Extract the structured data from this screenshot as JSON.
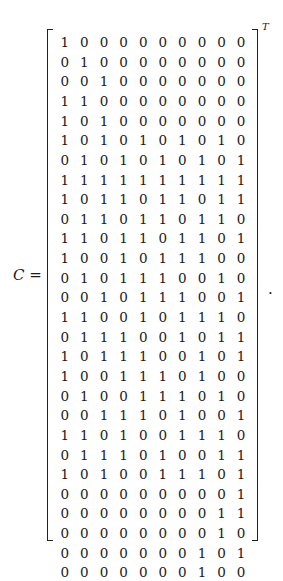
{
  "equation": {
    "lhs_var": "C",
    "equals": "=",
    "superscript": "T",
    "trailing_punct": "."
  },
  "matrix": {
    "rows": [
      [
        "1",
        "0",
        "0",
        "0",
        "0",
        "0",
        "0",
        "0",
        "0",
        "0"
      ],
      [
        "0",
        "1",
        "0",
        "0",
        "0",
        "0",
        "0",
        "0",
        "0",
        "0"
      ],
      [
        "0",
        "0",
        "1",
        "0",
        "0",
        "0",
        "0",
        "0",
        "0",
        "0"
      ],
      [
        "1",
        "1",
        "0",
        "0",
        "0",
        "0",
        "0",
        "0",
        "0",
        "0"
      ],
      [
        "1",
        "0",
        "1",
        "0",
        "0",
        "0",
        "0",
        "0",
        "0",
        "0"
      ],
      [
        "1",
        "0",
        "1",
        "0",
        "1",
        "0",
        "1",
        "0",
        "1",
        "0"
      ],
      [
        "0",
        "1",
        "0",
        "1",
        "0",
        "1",
        "0",
        "1",
        "0",
        "1"
      ],
      [
        "1",
        "1",
        "1",
        "1",
        "1",
        "1",
        "1",
        "1",
        "1",
        "1"
      ],
      [
        "1",
        "0",
        "1",
        "1",
        "0",
        "1",
        "1",
        "0",
        "1",
        "1"
      ],
      [
        "0",
        "1",
        "1",
        "0",
        "1",
        "1",
        "0",
        "1",
        "1",
        "0"
      ],
      [
        "1",
        "1",
        "0",
        "1",
        "1",
        "0",
        "1",
        "1",
        "0",
        "1"
      ],
      [
        "1",
        "0",
        "0",
        "1",
        "0",
        "1",
        "1",
        "1",
        "0",
        "0"
      ],
      [
        "0",
        "1",
        "0",
        "1",
        "1",
        "1",
        "0",
        "0",
        "1",
        "0"
      ],
      [
        "0",
        "0",
        "1",
        "0",
        "1",
        "1",
        "1",
        "0",
        "0",
        "1"
      ],
      [
        "1",
        "1",
        "0",
        "0",
        "1",
        "0",
        "1",
        "1",
        "1",
        "0"
      ],
      [
        "0",
        "1",
        "1",
        "1",
        "0",
        "0",
        "1",
        "0",
        "1",
        "1"
      ],
      [
        "1",
        "0",
        "1",
        "1",
        "1",
        "0",
        "0",
        "1",
        "0",
        "1"
      ],
      [
        "1",
        "0",
        "0",
        "1",
        "1",
        "1",
        "0",
        "1",
        "0",
        "0"
      ],
      [
        "0",
        "1",
        "0",
        "0",
        "1",
        "1",
        "1",
        "0",
        "1",
        "0"
      ],
      [
        "0",
        "0",
        "1",
        "1",
        "1",
        "0",
        "1",
        "0",
        "0",
        "1"
      ],
      [
        "1",
        "1",
        "0",
        "1",
        "0",
        "0",
        "1",
        "1",
        "1",
        "0"
      ],
      [
        "0",
        "1",
        "1",
        "1",
        "0",
        "1",
        "0",
        "0",
        "1",
        "1"
      ],
      [
        "1",
        "0",
        "1",
        "0",
        "0",
        "1",
        "1",
        "1",
        "0",
        "1"
      ],
      [
        "0",
        "0",
        "0",
        "0",
        "0",
        "0",
        "0",
        "0",
        "0",
        "1"
      ],
      [
        "0",
        "0",
        "0",
        "0",
        "0",
        "0",
        "0",
        "0",
        "1",
        "1"
      ],
      [
        "0",
        "0",
        "0",
        "0",
        "0",
        "0",
        "0",
        "0",
        "1",
        "0"
      ],
      [
        "0",
        "0",
        "0",
        "0",
        "0",
        "0",
        "0",
        "1",
        "0",
        "1"
      ],
      [
        "0",
        "0",
        "0",
        "0",
        "0",
        "0",
        "0",
        "1",
        "0",
        "0"
      ]
    ]
  }
}
